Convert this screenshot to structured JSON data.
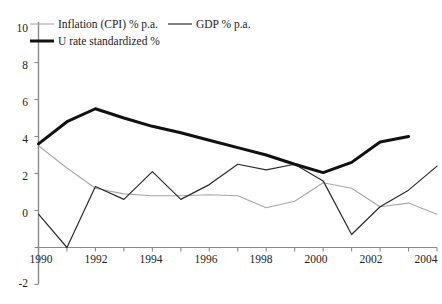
{
  "chart_data": {
    "type": "line",
    "title": "",
    "subtitle": "",
    "xlabel": "",
    "ylabel": "",
    "xlim": [
      1990,
      2004
    ],
    "ylim": [
      -2,
      10
    ],
    "grid": false,
    "legend_position": "top-left",
    "x_ticks": [
      "1990",
      "1992",
      "1994",
      "1996",
      "1998",
      "2000",
      "2002",
      "2004"
    ],
    "y_ticks": [
      "10",
      "8",
      "6",
      "4",
      "2",
      "0",
      "-2"
    ],
    "x": [
      1990,
      1991,
      1992,
      1993,
      1994,
      1995,
      1996,
      1997,
      1998,
      1999,
      2000,
      2001,
      2002,
      2003,
      2004
    ],
    "series": [
      {
        "name": "Inflation (CPI) % p.a.",
        "color": "#a8a8a8",
        "width": 1.1,
        "x": [
          1990,
          1991,
          1992,
          1993,
          1994,
          1995,
          1996,
          1997,
          1998,
          1999,
          2000,
          2001,
          2002,
          2003,
          2004
        ],
        "values": [
          5.5,
          4.3,
          3.2,
          2.9,
          2.8,
          2.8,
          2.85,
          2.8,
          2.15,
          2.5,
          3.5,
          3.2,
          2.2,
          2.4,
          1.8
        ]
      },
      {
        "name": "GDP % p.a.",
        "color": "#2b2b2b",
        "width": 1.2,
        "x": [
          1990,
          1991,
          1992,
          1993,
          1994,
          1995,
          1996,
          1997,
          1998,
          1999,
          2000,
          2001,
          2002,
          2003,
          2004
        ],
        "values": [
          1.8,
          0.0,
          3.3,
          2.6,
          4.1,
          2.6,
          3.4,
          4.5,
          4.2,
          4.5,
          3.6,
          0.7,
          2.2,
          3.1,
          4.4
        ]
      },
      {
        "name": "U rate standardized %",
        "color": "#111111",
        "width": 3.0,
        "x": [
          1990,
          1991,
          1992,
          1993,
          1994,
          1995,
          1996,
          1997,
          1998,
          1999,
          2000,
          2001,
          2002,
          2003
        ],
        "values": [
          5.6,
          6.8,
          7.5,
          7.0,
          6.55,
          6.2,
          5.8,
          5.4,
          5.0,
          4.5,
          4.05,
          4.6,
          5.7,
          6.0
        ]
      }
    ]
  },
  "legend": {
    "items": [
      {
        "label": "Inflation (CPI) % p.a."
      },
      {
        "label": "GDP % p.a."
      },
      {
        "label": "U rate standardized %"
      }
    ]
  },
  "axes": {
    "y_labels": [
      "10",
      "8",
      "6",
      "4",
      "2",
      "0",
      "-2"
    ],
    "x_labels": [
      "1990",
      "1992",
      "1994",
      "1996",
      "1998",
      "2000",
      "2002",
      "2004"
    ]
  }
}
